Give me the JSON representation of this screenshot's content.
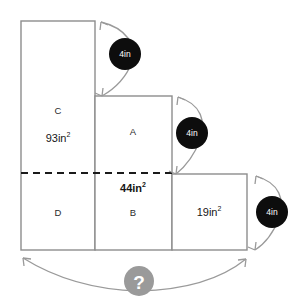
{
  "figure": {
    "background_color": "#ffffff",
    "outline_color": "#8d8d8d",
    "dashed_line_color": "#1a1a1a",
    "arc_color": "#9a9a9a",
    "badge_fill": "#0d0d0d",
    "badge_text_color": "#ffffff",
    "question_fill": "#9a9a9a",
    "question_text_color": "#ffffff"
  },
  "regions": [
    {
      "id": "C",
      "letter": "C",
      "area_value": "93",
      "area_unit": "in",
      "area_exponent": "2",
      "area_text": "93in²",
      "bold_area": false,
      "x": 21,
      "y": 21,
      "width": 74,
      "height": 152
    },
    {
      "id": "D",
      "letter": "D",
      "area_value": "",
      "area_unit": "",
      "area_exponent": "",
      "area_text": "",
      "bold_area": false,
      "x": 21,
      "y": 173,
      "width": 74,
      "height": 77
    },
    {
      "id": "A",
      "letter": "A",
      "area_value": "",
      "area_unit": "",
      "area_exponent": "",
      "area_text": "",
      "bold_area": false,
      "x": 95,
      "y": 96,
      "width": 77,
      "height": 77
    },
    {
      "id": "B",
      "letter": "B",
      "area_value": "44",
      "area_unit": "in",
      "area_exponent": "2",
      "area_text": "44in²",
      "bold_area": true,
      "x": 95,
      "y": 173,
      "width": 77,
      "height": 77
    },
    {
      "id": "E",
      "letter": "",
      "area_value": "19",
      "area_unit": "in",
      "area_exponent": "2",
      "area_text": "19in²",
      "bold_area": false,
      "x": 172,
      "y": 174,
      "width": 75,
      "height": 76
    }
  ],
  "labels": {
    "letter_c": "C",
    "letter_d": "D",
    "letter_a": "A",
    "letter_b": "B",
    "area_c": "93in",
    "area_c_sup": "2",
    "area_b": "44in",
    "area_b_sup": "2",
    "area_e": "19in",
    "area_e_sup": "2"
  },
  "dimension_badges": [
    {
      "id": "badge-top",
      "label": "4in",
      "cx": 125,
      "cy": 54,
      "r": 16
    },
    {
      "id": "badge-middle",
      "label": "4in",
      "cx": 192,
      "cy": 133,
      "r": 16
    },
    {
      "id": "badge-right",
      "label": "4in",
      "cx": 272,
      "cy": 212,
      "r": 16
    }
  ],
  "question_marker": {
    "label": "?",
    "cx": 139,
    "cy": 281,
    "r": 15
  },
  "dashed_divider": {
    "x1": 21,
    "y1": 173,
    "x2": 172,
    "y2": 173,
    "description": "horizontal dashed split line"
  }
}
